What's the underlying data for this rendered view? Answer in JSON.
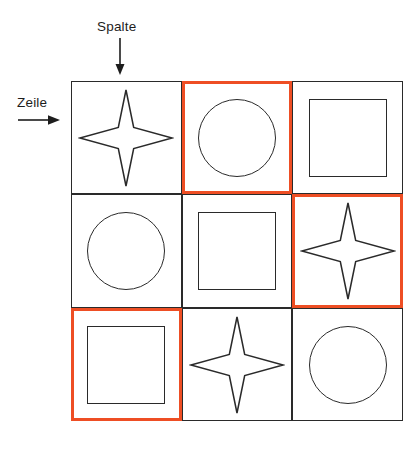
{
  "annotations": {
    "column_label": "Spalte",
    "column_arrow_icon": "arrow-down-icon",
    "row_label": "Zeile",
    "row_arrow_icon": "arrow-right-icon"
  },
  "colors": {
    "highlight": "#ee4e24",
    "stroke": "#2a2a2a",
    "background": "#ffffff"
  },
  "grid": {
    "rows": 3,
    "columns": 3,
    "cells": [
      {
        "row": 1,
        "column": 1,
        "shape": "star",
        "highlighted": false
      },
      {
        "row": 1,
        "column": 2,
        "shape": "circle",
        "highlighted": true
      },
      {
        "row": 1,
        "column": 3,
        "shape": "square",
        "highlighted": false
      },
      {
        "row": 2,
        "column": 1,
        "shape": "circle",
        "highlighted": false
      },
      {
        "row": 2,
        "column": 2,
        "shape": "square",
        "highlighted": false
      },
      {
        "row": 2,
        "column": 3,
        "shape": "star",
        "highlighted": true
      },
      {
        "row": 3,
        "column": 1,
        "shape": "square",
        "highlighted": true
      },
      {
        "row": 3,
        "column": 2,
        "shape": "star",
        "highlighted": false
      },
      {
        "row": 3,
        "column": 3,
        "shape": "circle",
        "highlighted": false
      }
    ]
  }
}
